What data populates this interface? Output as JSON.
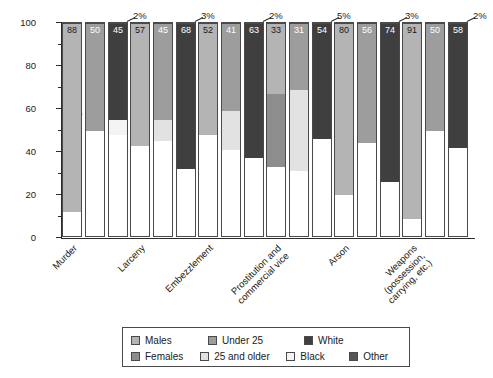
{
  "chart_data": {
    "type": "bar",
    "subtype": "stacked-100-grouped",
    "title": "",
    "xlabel": "",
    "ylabel": "Percentage",
    "ylim": [
      0,
      100
    ],
    "yticks": [
      0,
      20,
      40,
      60,
      80,
      100
    ],
    "ytick_labels": [
      "0",
      "20",
      "40",
      "60",
      "80",
      "100"
    ],
    "yticks_minor": [
      10,
      30,
      50,
      70,
      90
    ],
    "grid": false,
    "legend_position": "bottom",
    "categories": [
      "Murder",
      "Larceny",
      "Embezzlement",
      "Prostitution and commercial vice",
      "Arson",
      "Weapons (possession, carrying, etc.)"
    ],
    "legend_entries": [
      "Males",
      "Females",
      "Under 25",
      "25 and older",
      "White",
      "Black",
      "Other"
    ],
    "series": [
      {
        "name": "Males",
        "stack": "sex",
        "values": [
          88,
          57,
          52,
          33,
          80,
          91
        ]
      },
      {
        "name": "Females",
        "stack": "sex",
        "values": [
          12,
          43,
          48,
          67,
          20,
          9
        ]
      },
      {
        "name": "Under 25",
        "stack": "age",
        "values": [
          50,
          45,
          41,
          31,
          56,
          50
        ]
      },
      {
        "name": "25 and older",
        "stack": "age",
        "values": [
          50,
          55,
          59,
          69,
          44,
          50
        ]
      },
      {
        "name": "White",
        "stack": "race",
        "values": [
          45,
          68,
          63,
          54,
          74,
          58
        ]
      },
      {
        "name": "Black",
        "stack": "race",
        "values": [
          52,
          29,
          35,
          41,
          23,
          40
        ]
      },
      {
        "name": "Other",
        "stack": "race",
        "values": [
          2,
          3,
          2,
          5,
          3,
          2
        ]
      }
    ],
    "annotations": [
      {
        "text": "2%",
        "category": "Murder",
        "series": "Other"
      },
      {
        "text": "3%",
        "category": "Larceny",
        "series": "Other"
      },
      {
        "text": "2%",
        "category": "Embezzlement",
        "series": "Other"
      },
      {
        "text": "5%",
        "category": "Prostitution and commercial vice",
        "series": "Other"
      },
      {
        "text": "3%",
        "category": "Arson",
        "series": "Other"
      },
      {
        "text": "2%",
        "category": "Weapons (possession, carrying, etc.)",
        "series": "Other"
      }
    ],
    "colors": {
      "males": "#b4b4b4",
      "females": "#8d8d8d",
      "under25": "#9d9d9d",
      "older25": "#e2e2e2",
      "white": "#3f3f3f",
      "black": "#f4f4f4",
      "other": "#565656",
      "axis": "#2b2b2b",
      "outline": "#4a4a4a",
      "background": "#ffffff"
    }
  },
  "axis": {
    "y_title": "Percentage",
    "y_labels": [
      "100",
      "80",
      "60",
      "40",
      "20",
      "0"
    ]
  },
  "x_labels": [
    {
      "lines": [
        "Murder"
      ]
    },
    {
      "lines": [
        "Larceny"
      ]
    },
    {
      "lines": [
        "Embezzlement"
      ]
    },
    {
      "lines": [
        "Prostitution and",
        "commercial vice"
      ]
    },
    {
      "lines": [
        "Arson"
      ]
    },
    {
      "lines": [
        "Weapons",
        "(possession,",
        "carrying, etc.)"
      ]
    }
  ],
  "legend": {
    "row1": [
      {
        "label": "Males",
        "color": "#b4b4b4"
      },
      {
        "label": "Under 25",
        "color": "#9d9d9d"
      },
      {
        "label": "White",
        "color": "#3f3f3f"
      }
    ],
    "row2": [
      {
        "label": "Females",
        "color": "#8d8d8d"
      },
      {
        "label": "25 and older",
        "color": "#e2e2e2"
      },
      {
        "label": "Black",
        "color": "#f4f4f4"
      },
      {
        "label": "Other",
        "color": "#565656"
      }
    ]
  },
  "bar_labels": {
    "murder": {
      "females": "12",
      "males": "88",
      "older25": "50",
      "under25": "50",
      "black": "52",
      "white": "45",
      "other": "2%"
    },
    "larceny": {
      "females": "43",
      "males": "57",
      "older25": "55",
      "under25": "45",
      "black": "29",
      "white": "68",
      "other": "3%"
    },
    "embezzlement": {
      "females": "48",
      "males": "52",
      "older25": "59",
      "under25": "41",
      "black": "35",
      "white": "63",
      "other": "2%"
    },
    "prostitution": {
      "females": "67",
      "males": "33",
      "older25": "69",
      "under25": "31",
      "black": "41",
      "white": "54",
      "other": "5%"
    },
    "arson": {
      "females": "20",
      "males": "80",
      "older25": "44",
      "under25": "56",
      "black": "23",
      "white": "74",
      "other": "3%"
    },
    "weapons": {
      "females": "9",
      "males": "91",
      "older25": "50",
      "under25": "50",
      "black": "40",
      "white": "58",
      "other": "2%"
    }
  }
}
